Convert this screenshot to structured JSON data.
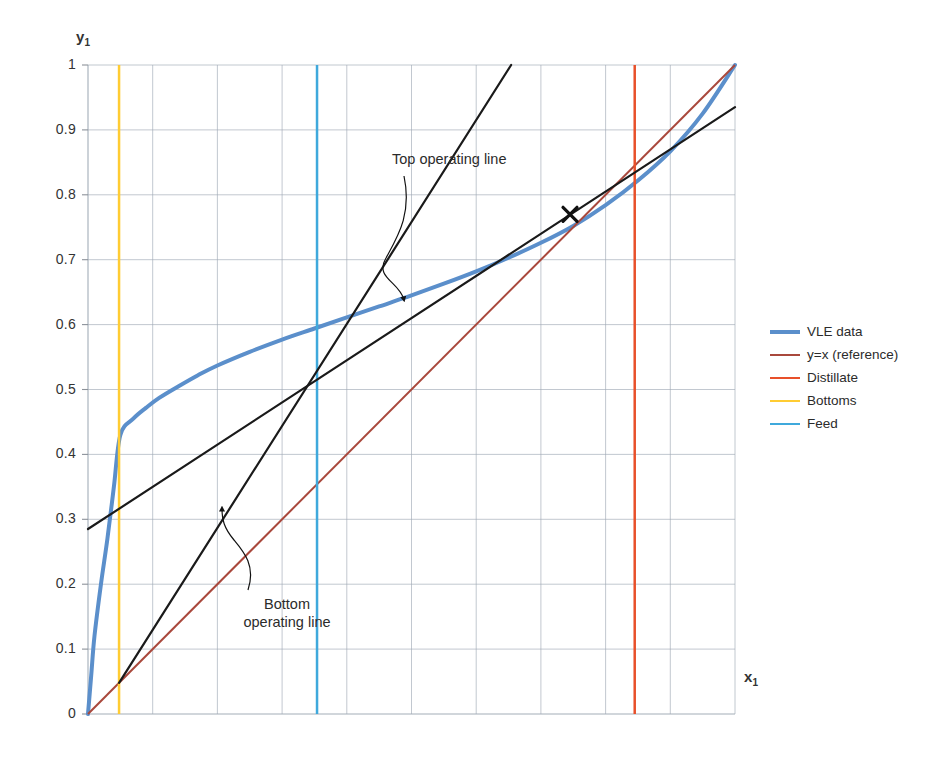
{
  "chart_data": {
    "type": "line",
    "title": "",
    "xlabel": "x1",
    "ylabel": "y1",
    "xlim": [
      0,
      1
    ],
    "ylim": [
      0,
      1
    ],
    "xticks": [
      0,
      0.1,
      0.2,
      0.3,
      0.4,
      0.5,
      0.6,
      0.7,
      0.8,
      0.9,
      1
    ],
    "yticks": [
      "0",
      "0.1",
      "0.2",
      "0.3",
      "0.4",
      "0.5",
      "0.6",
      "0.7",
      "0.8",
      "0.9",
      "1"
    ],
    "grid": true,
    "legend_position": "right",
    "series": [
      {
        "name": "VLE data",
        "color": "#5B8FCB",
        "width": 4,
        "x": [
          0,
          0.005,
          0.01,
          0.02,
          0.03,
          0.04,
          0.05,
          0.07,
          0.09,
          0.11,
          0.14,
          0.17,
          0.2,
          0.25,
          0.3,
          0.35,
          0.4,
          0.45,
          0.5,
          0.55,
          0.6,
          0.65,
          0.7,
          0.75,
          0.8,
          0.85,
          0.9,
          0.95,
          1.0
        ],
        "y": [
          0,
          0.06,
          0.12,
          0.2,
          0.27,
          0.35,
          0.43,
          0.455,
          0.472,
          0.487,
          0.505,
          0.522,
          0.537,
          0.558,
          0.577,
          0.594,
          0.611,
          0.628,
          0.645,
          0.663,
          0.682,
          0.703,
          0.726,
          0.752,
          0.784,
          0.822,
          0.867,
          0.925,
          1.0
        ]
      },
      {
        "name": "y=x (reference)",
        "color": "#A9483C",
        "width": 2,
        "x": [
          0,
          1
        ],
        "y": [
          0,
          1
        ]
      },
      {
        "name": "Distillate",
        "color": "#E8502A",
        "width": 2.5,
        "x": [
          0.845,
          0.845
        ],
        "y": [
          0,
          1
        ]
      },
      {
        "name": "Bottoms",
        "color": "#FFCC33",
        "width": 2.5,
        "x": [
          0.048,
          0.048
        ],
        "y": [
          0,
          1
        ]
      },
      {
        "name": "Feed",
        "color": "#3FA9DC",
        "width": 2.5,
        "x": [
          0.354,
          0.354
        ],
        "y": [
          0,
          1
        ]
      }
    ],
    "operating_lines": [
      {
        "name": "Top operating line",
        "color": "#1a1a1a",
        "width": 2.2,
        "x": [
          0,
          1
        ],
        "y": [
          0.285,
          0.935
        ],
        "note": "from y-intercept 0.285 through feed intersection (0.354, 0.51)"
      },
      {
        "name": "Bottom operating line",
        "color": "#1a1a1a",
        "width": 2.2,
        "x": [
          0.048,
          0.654
        ],
        "y": [
          0.048,
          1.0
        ],
        "note": "from bottoms point (0.048,0.048) through feed intersection (0.354,0.51)"
      }
    ],
    "markers": [
      {
        "name": "step-cross",
        "symbol": "x",
        "x": 0.745,
        "y": 0.77
      }
    ],
    "annotations": [
      {
        "name": "top-operating-line",
        "text": "Top operating line",
        "x": 0.47,
        "y": 0.855
      },
      {
        "name": "bottom-operating-line",
        "text_lines": [
          "Bottom",
          "operating line"
        ],
        "x": 0.255,
        "y": 0.165
      }
    ]
  },
  "axes": {
    "y_title": "y",
    "y_title_sub": "1",
    "x_title": "x",
    "x_title_sub": "1"
  },
  "legend": {
    "items": [
      {
        "label": "VLE data",
        "color": "#5B8FCB",
        "thickness": "4px"
      },
      {
        "label": "y=x (reference)",
        "color": "#A9483C",
        "thickness": "2px"
      },
      {
        "label": "Distillate",
        "color": "#E8502A",
        "thickness": "2.5px"
      },
      {
        "label": "Bottoms",
        "color": "#FFCC33",
        "thickness": "2.5px"
      },
      {
        "label": "Feed",
        "color": "#3FA9DC",
        "thickness": "2.5px"
      }
    ]
  },
  "annotations": {
    "top_label": "Top operating line",
    "bottom_label_line1": "Bottom",
    "bottom_label_line2": "operating line"
  },
  "colors": {
    "grid": "#9fa9b5",
    "axis": "#8c929a",
    "text": "#2b2b2b",
    "operating_line": "#1a1a1a",
    "background": "#ffffff"
  }
}
